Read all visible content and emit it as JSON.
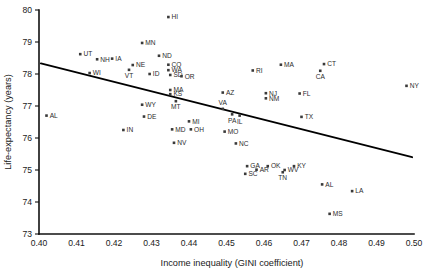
{
  "chart_data": {
    "type": "scatter",
    "title": "",
    "xlabel": "Income inequality (GINI coefficient)",
    "ylabel": "Life-expectancy (years)",
    "xlim": [
      0.4,
      0.5
    ],
    "ylim": [
      73,
      80
    ],
    "xticks": [
      "0.40",
      "0.41",
      "0.42",
      "0.43",
      "0.44",
      "0.45",
      "0.46",
      "0.47",
      "0.48",
      "0.49",
      "0.50"
    ],
    "xtick_values": [
      0.4,
      0.41,
      0.42,
      0.43,
      0.44,
      0.45,
      0.46,
      0.47,
      0.48,
      0.49,
      0.5
    ],
    "yticks": [
      "73",
      "74",
      "75",
      "76",
      "77",
      "78",
      "79",
      "80"
    ],
    "ytick_values": [
      73,
      74,
      75,
      76,
      77,
      78,
      79,
      80
    ],
    "grid": false,
    "legend": "none",
    "marker_color": "#3a3a3a",
    "line_color": "#000000",
    "axis_color": "#111111",
    "trendline": {
      "type": "linear",
      "x_start": 0.4005,
      "y_start": 78.33,
      "x_end": 0.4995,
      "y_end": 75.4
    },
    "point_label_field": "state",
    "points": [
      {
        "state": "AL",
        "x": 0.402,
        "y": 76.7,
        "label_pos": "right"
      },
      {
        "state": "UT",
        "x": 0.411,
        "y": 78.62,
        "label_pos": "right"
      },
      {
        "state": "WI",
        "x": 0.4135,
        "y": 78.03,
        "label_pos": "right"
      },
      {
        "state": "NH",
        "x": 0.4155,
        "y": 78.46,
        "label_pos": "right"
      },
      {
        "state": "IA",
        "x": 0.4195,
        "y": 78.48,
        "label_pos": "right"
      },
      {
        "state": "IN",
        "x": 0.4225,
        "y": 76.25,
        "label_pos": "right"
      },
      {
        "state": "VT",
        "x": 0.424,
        "y": 78.13,
        "label_pos": "below"
      },
      {
        "state": "NE",
        "x": 0.425,
        "y": 78.28,
        "label_pos": "right"
      },
      {
        "state": "MN",
        "x": 0.4275,
        "y": 78.97,
        "label_pos": "right"
      },
      {
        "state": "DE",
        "x": 0.428,
        "y": 76.67,
        "label_pos": "right"
      },
      {
        "state": "ID",
        "x": 0.4295,
        "y": 78.0,
        "label_pos": "right"
      },
      {
        "state": "ND",
        "x": 0.432,
        "y": 78.57,
        "label_pos": "right"
      },
      {
        "state": "HI",
        "x": 0.4345,
        "y": 79.78,
        "label_pos": "right"
      },
      {
        "state": "CO",
        "x": 0.4345,
        "y": 78.29,
        "label_pos": "right"
      },
      {
        "state": "WA",
        "x": 0.4345,
        "y": 78.12,
        "label_pos": "right"
      },
      {
        "state": "SD",
        "x": 0.435,
        "y": 77.97,
        "label_pos": "right"
      },
      {
        "state": "MA",
        "x": 0.435,
        "y": 77.5,
        "label_pos": "right"
      },
      {
        "state": "KS",
        "x": 0.435,
        "y": 77.37,
        "label_pos": "right"
      },
      {
        "state": "MD",
        "x": 0.4355,
        "y": 76.27,
        "label_pos": "right"
      },
      {
        "state": "NV",
        "x": 0.436,
        "y": 75.85,
        "label_pos": "right"
      },
      {
        "state": "WY",
        "x": 0.4275,
        "y": 77.04,
        "label_pos": "right"
      },
      {
        "state": "MT",
        "x": 0.4365,
        "y": 77.15,
        "label_pos": "below"
      },
      {
        "state": "OR",
        "x": 0.438,
        "y": 77.93,
        "label_pos": "right"
      },
      {
        "state": "MI",
        "x": 0.44,
        "y": 76.52,
        "label_pos": "right"
      },
      {
        "state": "OH",
        "x": 0.4405,
        "y": 76.27,
        "label_pos": "right"
      },
      {
        "state": "VA",
        "x": 0.449,
        "y": 76.91,
        "label_pos": "above"
      },
      {
        "state": "AZ",
        "x": 0.449,
        "y": 77.42,
        "label_pos": "right"
      },
      {
        "state": "MO",
        "x": 0.4495,
        "y": 76.2,
        "label_pos": "right"
      },
      {
        "state": "PA",
        "x": 0.4515,
        "y": 76.74,
        "label_pos": "below"
      },
      {
        "state": "NC",
        "x": 0.4525,
        "y": 75.83,
        "label_pos": "right"
      },
      {
        "state": "IL",
        "x": 0.4535,
        "y": 76.7,
        "label_pos": "below"
      },
      {
        "state": "GA",
        "x": 0.4555,
        "y": 75.12,
        "label_pos": "right"
      },
      {
        "state": "SC",
        "x": 0.455,
        "y": 74.88,
        "label_pos": "right"
      },
      {
        "state": "AR",
        "x": 0.458,
        "y": 75.01,
        "label_pos": "right"
      },
      {
        "state": "RI",
        "x": 0.457,
        "y": 78.11,
        "label_pos": "right"
      },
      {
        "state": "NJ",
        "x": 0.4605,
        "y": 77.4,
        "label_pos": "right"
      },
      {
        "state": "NM",
        "x": 0.4605,
        "y": 77.24,
        "label_pos": "right"
      },
      {
        "state": "OK",
        "x": 0.461,
        "y": 75.12,
        "label_pos": "right"
      },
      {
        "state": "MA",
        "x": 0.4645,
        "y": 78.29,
        "label_pos": "right"
      },
      {
        "state": "TN",
        "x": 0.465,
        "y": 74.93,
        "label_pos": "below"
      },
      {
        "state": "WV",
        "x": 0.4655,
        "y": 75.0,
        "label_pos": "right"
      },
      {
        "state": "KY",
        "x": 0.468,
        "y": 75.12,
        "label_pos": "right"
      },
      {
        "state": "FL",
        "x": 0.4695,
        "y": 77.39,
        "label_pos": "right"
      },
      {
        "state": "TX",
        "x": 0.47,
        "y": 76.66,
        "label_pos": "right"
      },
      {
        "state": "CA",
        "x": 0.475,
        "y": 78.1,
        "label_pos": "below"
      },
      {
        "state": "CT",
        "x": 0.476,
        "y": 78.31,
        "label_pos": "right"
      },
      {
        "state": "AL",
        "x": 0.4755,
        "y": 74.55,
        "label_pos": "right"
      },
      {
        "state": "MS",
        "x": 0.4775,
        "y": 73.63,
        "label_pos": "right"
      },
      {
        "state": "LA",
        "x": 0.4835,
        "y": 74.34,
        "label_pos": "right"
      },
      {
        "state": "NY",
        "x": 0.498,
        "y": 77.63,
        "label_pos": "right"
      }
    ]
  }
}
